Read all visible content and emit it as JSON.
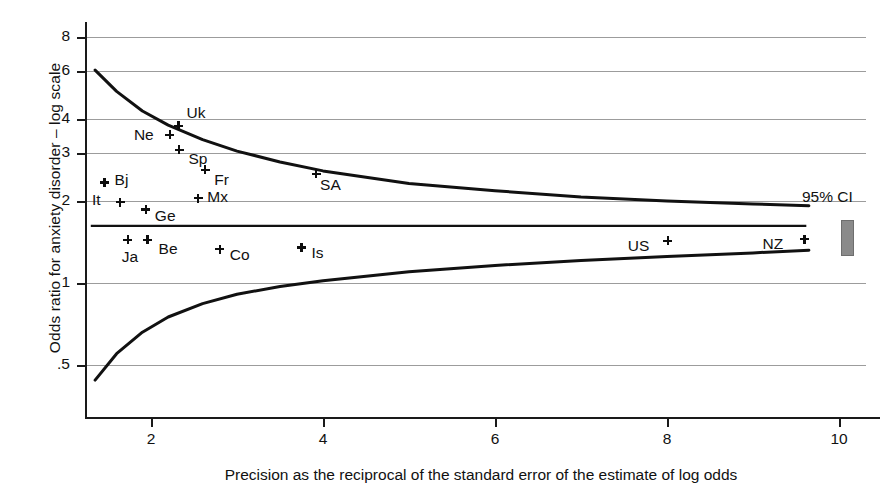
{
  "chart_data": {
    "type": "scatter",
    "title": "",
    "xlabel": "Precision as the reciprocal of the standard error of the estimate of log odds",
    "ylabel": "Odds ratio for anxiety disorder – log scale",
    "xlim": [
      1.25,
      10.55
    ],
    "ylim": [
      0.42,
      8.6
    ],
    "yscale": "log",
    "grid": true,
    "legend": "none",
    "xticks": [
      "2",
      "4",
      "6",
      "8",
      "10"
    ],
    "xtick_values": [
      2,
      4,
      6,
      8,
      10
    ],
    "yticks": [
      ".5",
      "1",
      "2",
      "3",
      "4",
      "6",
      "8"
    ],
    "ytick_values": [
      0.5,
      1,
      2,
      3,
      4,
      6,
      8
    ],
    "annotation": "95% CI",
    "pooled_estimate": 1.62,
    "points": [
      {
        "label": "Uk",
        "x": 2.32,
        "y": 3.78,
        "lx": 8,
        "ly": -20
      },
      {
        "label": "Ne",
        "x": 2.22,
        "y": 3.5,
        "lx": -36,
        "ly": -7
      },
      {
        "label": "Sp",
        "x": 2.33,
        "y": 3.08,
        "lx": 9,
        "ly": 2
      },
      {
        "label": "Fr",
        "x": 2.63,
        "y": 2.6,
        "lx": 9,
        "ly": 3
      },
      {
        "label": "SA",
        "x": 3.92,
        "y": 2.52,
        "lx": 4,
        "ly": 4
      },
      {
        "label": "Bj",
        "x": 1.46,
        "y": 2.34,
        "lx": 10,
        "ly": -9
      },
      {
        "label": "Mx",
        "x": 2.55,
        "y": 2.05,
        "lx": 9,
        "ly": -8
      },
      {
        "label": "It",
        "x": 1.64,
        "y": 1.98,
        "lx": -28,
        "ly": -9
      },
      {
        "label": "Ge",
        "x": 1.94,
        "y": 1.86,
        "lx": 9,
        "ly": -1
      },
      {
        "label": "Ja",
        "x": 1.73,
        "y": 1.44,
        "lx": -6,
        "ly": 10
      },
      {
        "label": "Be",
        "x": 1.96,
        "y": 1.44,
        "lx": 11,
        "ly": 2
      },
      {
        "label": "Co",
        "x": 2.8,
        "y": 1.33,
        "lx": 10,
        "ly": -1
      },
      {
        "label": "Is",
        "x": 3.75,
        "y": 1.35,
        "lx": 10,
        "ly": -1
      },
      {
        "label": "US",
        "x": 8.01,
        "y": 1.43,
        "lx": -40,
        "ly": -2
      },
      {
        "label": "NZ",
        "x": 9.6,
        "y": 1.45,
        "lx": -42,
        "ly": -2
      }
    ],
    "funnel_upper": [
      {
        "x": 1.35,
        "y": 6.05
      },
      {
        "x": 1.6,
        "y": 5.05
      },
      {
        "x": 1.9,
        "y": 4.28
      },
      {
        "x": 2.2,
        "y": 3.8
      },
      {
        "x": 2.6,
        "y": 3.36
      },
      {
        "x": 3.0,
        "y": 3.05
      },
      {
        "x": 3.5,
        "y": 2.78
      },
      {
        "x": 4.0,
        "y": 2.58
      },
      {
        "x": 5.0,
        "y": 2.32
      },
      {
        "x": 6.0,
        "y": 2.18
      },
      {
        "x": 7.0,
        "y": 2.07
      },
      {
        "x": 8.0,
        "y": 2.0
      },
      {
        "x": 9.0,
        "y": 1.95
      },
      {
        "x": 9.65,
        "y": 1.92
      }
    ],
    "funnel_lower": [
      {
        "x": 1.35,
        "y": 0.44
      },
      {
        "x": 1.6,
        "y": 0.55
      },
      {
        "x": 1.9,
        "y": 0.66
      },
      {
        "x": 2.2,
        "y": 0.75
      },
      {
        "x": 2.6,
        "y": 0.84
      },
      {
        "x": 3.0,
        "y": 0.91
      },
      {
        "x": 3.5,
        "y": 0.97
      },
      {
        "x": 4.0,
        "y": 1.02
      },
      {
        "x": 5.0,
        "y": 1.1
      },
      {
        "x": 6.0,
        "y": 1.16
      },
      {
        "x": 7.0,
        "y": 1.21
      },
      {
        "x": 8.0,
        "y": 1.25
      },
      {
        "x": 9.0,
        "y": 1.29
      },
      {
        "x": 9.65,
        "y": 1.32
      }
    ],
    "colors": {
      "curve": "#111111",
      "grid": "#9c9c9c",
      "axis": "#1a1a1a",
      "marker": "#0d0d0d",
      "ci_bar": "#8a8a8a"
    }
  }
}
